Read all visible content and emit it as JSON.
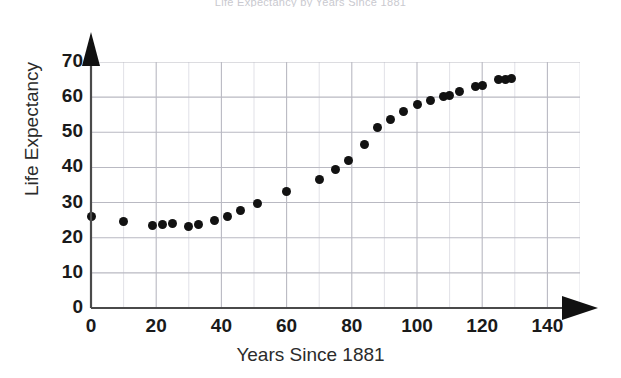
{
  "chart_data": {
    "type": "scatter",
    "title": "Life Expectancy by Years Since 1881",
    "xlabel": "Years Since 1881",
    "ylabel": "Life Expectancy",
    "xlim": [
      0,
      150
    ],
    "ylim": [
      0,
      70
    ],
    "x_ticks": [
      0,
      20,
      40,
      60,
      80,
      100,
      120,
      140
    ],
    "y_ticks": [
      0,
      10,
      20,
      30,
      40,
      50,
      60,
      70
    ],
    "x_minor_step": 10,
    "y_minor_step": 10,
    "grid": true,
    "legend": null,
    "marker": "filled-circle",
    "marker_color": "#121212",
    "axis_arrows": true,
    "points": [
      {
        "x": 0,
        "y": 26
      },
      {
        "x": 10,
        "y": 24.5
      },
      {
        "x": 19,
        "y": 23.5
      },
      {
        "x": 22,
        "y": 23.8
      },
      {
        "x": 25,
        "y": 24
      },
      {
        "x": 30,
        "y": 23.2
      },
      {
        "x": 33,
        "y": 23.8
      },
      {
        "x": 38,
        "y": 24.8
      },
      {
        "x": 42,
        "y": 26
      },
      {
        "x": 46,
        "y": 27.8
      },
      {
        "x": 51,
        "y": 29.8
      },
      {
        "x": 60,
        "y": 33.2
      },
      {
        "x": 70,
        "y": 36.5
      },
      {
        "x": 75,
        "y": 39.5
      },
      {
        "x": 79,
        "y": 42
      },
      {
        "x": 84,
        "y": 46.5
      },
      {
        "x": 88,
        "y": 51.5
      },
      {
        "x": 92,
        "y": 53.5
      },
      {
        "x": 96,
        "y": 56
      },
      {
        "x": 100,
        "y": 57.8
      },
      {
        "x": 104,
        "y": 59
      },
      {
        "x": 108,
        "y": 60.2
      },
      {
        "x": 110,
        "y": 60.4
      },
      {
        "x": 113,
        "y": 61.5
      },
      {
        "x": 118,
        "y": 63
      },
      {
        "x": 120,
        "y": 63.2
      },
      {
        "x": 125,
        "y": 65
      },
      {
        "x": 127,
        "y": 65.1
      },
      {
        "x": 129,
        "y": 65.2
      }
    ]
  },
  "axis": {
    "y_title": "Life Expectancy",
    "x_title": "Years Since 1881",
    "origin_label": "0"
  }
}
